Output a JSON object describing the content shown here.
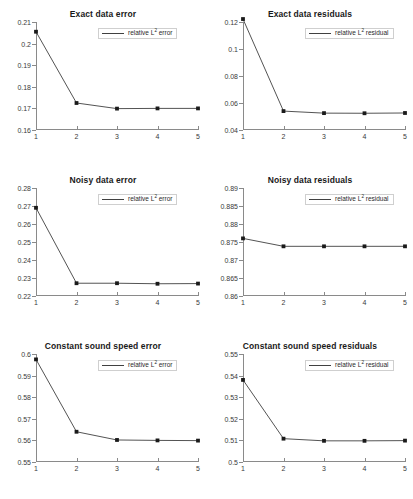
{
  "figure": {
    "rows": 3,
    "cols": 2,
    "background": "#ffffff",
    "line_color": "#404040",
    "marker_color": "#1a1a1a",
    "axis_color": "#8a8a8a"
  },
  "chart_data": [
    {
      "type": "line",
      "panel": "top-left",
      "title": "Exact data error",
      "xlabel": "",
      "ylabel": "",
      "x": [
        1,
        2,
        3,
        4,
        5
      ],
      "values": [
        0.2055,
        0.1725,
        0.1699,
        0.17,
        0.17
      ],
      "series": [
        {
          "name": "relative L2 error",
          "legend_prefix": "relative L",
          "legend_sup": "2",
          "legend_suffix": " error",
          "values": [
            0.2055,
            0.1725,
            0.1699,
            0.17,
            0.17
          ]
        }
      ],
      "xlim": [
        1,
        5
      ],
      "ylim": [
        0.16,
        0.21
      ],
      "yticks": [
        0.16,
        0.17,
        0.18,
        0.19,
        0.2,
        0.21
      ],
      "ytick_labels": [
        "0.16",
        "0.17",
        "0.18",
        "0.19",
        "0.2",
        "0.21"
      ],
      "xticks": [
        1,
        2,
        3,
        4,
        5
      ],
      "xtick_labels": [
        "1",
        "2",
        "3",
        "4",
        "5"
      ],
      "grid": false,
      "legend_position": "top-right",
      "marker": "square"
    },
    {
      "type": "line",
      "panel": "top-right",
      "title": "Exact data residuals",
      "xlabel": "",
      "ylabel": "",
      "x": [
        1,
        2,
        3,
        4,
        5
      ],
      "values": [
        0.1222,
        0.054,
        0.0525,
        0.0524,
        0.0526
      ],
      "series": [
        {
          "name": "relative L2 residual",
          "legend_prefix": "relative L",
          "legend_sup": "2",
          "legend_suffix": " residual",
          "values": [
            0.1222,
            0.054,
            0.0525,
            0.0524,
            0.0526
          ]
        }
      ],
      "xlim": [
        1,
        5
      ],
      "ylim": [
        0.04,
        0.12
      ],
      "yticks": [
        0.04,
        0.06,
        0.08,
        0.1,
        0.12
      ],
      "ytick_labels": [
        "0.04",
        "0.06",
        "0.08",
        "0.1",
        "0.12"
      ],
      "xticks": [
        1,
        2,
        3,
        4,
        5
      ],
      "xtick_labels": [
        "1",
        "2",
        "3",
        "4",
        "5"
      ],
      "grid": false,
      "legend_position": "top-right",
      "marker": "square"
    },
    {
      "type": "line",
      "panel": "middle-left",
      "title": "Noisy data error",
      "xlabel": "",
      "ylabel": "",
      "x": [
        1,
        2,
        3,
        4,
        5
      ],
      "values": [
        0.269,
        0.2271,
        0.2271,
        0.2268,
        0.2269
      ],
      "series": [
        {
          "name": "relative L2 error",
          "legend_prefix": "relative L",
          "legend_sup": "2",
          "legend_suffix": " error",
          "values": [
            0.269,
            0.2271,
            0.2271,
            0.2268,
            0.2269
          ]
        }
      ],
      "xlim": [
        1,
        5
      ],
      "ylim": [
        0.22,
        0.28
      ],
      "yticks": [
        0.22,
        0.23,
        0.24,
        0.25,
        0.26,
        0.27,
        0.28
      ],
      "ytick_labels": [
        "0.22",
        "0.23",
        "0.24",
        "0.25",
        "0.26",
        "0.27",
        "0.28"
      ],
      "xticks": [
        1,
        2,
        3,
        4,
        5
      ],
      "xtick_labels": [
        "1",
        "2",
        "3",
        "4",
        "5"
      ],
      "grid": false,
      "legend_position": "top-right",
      "marker": "square"
    },
    {
      "type": "line",
      "panel": "middle-right",
      "title": "Noisy data residuals",
      "xlabel": "",
      "ylabel": "",
      "x": [
        1,
        2,
        3,
        4,
        5
      ],
      "values": [
        0.876,
        0.8738,
        0.8738,
        0.8738,
        0.8738
      ],
      "series": [
        {
          "name": "relative L2 residual",
          "legend_prefix": "relative L",
          "legend_sup": "2",
          "legend_suffix": " residual",
          "values": [
            0.876,
            0.8738,
            0.8738,
            0.8738,
            0.8738
          ]
        }
      ],
      "xlim": [
        1,
        5
      ],
      "ylim": [
        0.86,
        0.89
      ],
      "yticks": [
        0.86,
        0.865,
        0.87,
        0.875,
        0.88,
        0.885,
        0.89
      ],
      "ytick_labels": [
        "0.86",
        "0.865",
        "0.87",
        "0.875",
        "0.88",
        "0.885",
        "0.89"
      ],
      "xticks": [
        1,
        2,
        3,
        4,
        5
      ],
      "xtick_labels": [
        "1",
        "2",
        "3",
        "4",
        "5"
      ],
      "grid": false,
      "legend_position": "top-right",
      "marker": "square"
    },
    {
      "type": "line",
      "panel": "bottom-left",
      "title": "Constant sound speed error",
      "xlabel": "",
      "ylabel": "",
      "x": [
        1,
        2,
        3,
        4,
        5
      ],
      "values": [
        0.5975,
        0.564,
        0.5602,
        0.56,
        0.5599
      ],
      "series": [
        {
          "name": "relative L2 error",
          "legend_prefix": "relative L",
          "legend_sup": "2",
          "legend_suffix": " error",
          "values": [
            0.5975,
            0.564,
            0.5602,
            0.56,
            0.5599
          ]
        }
      ],
      "xlim": [
        1,
        5
      ],
      "ylim": [
        0.55,
        0.6
      ],
      "yticks": [
        0.55,
        0.56,
        0.57,
        0.58,
        0.59,
        0.6
      ],
      "ytick_labels": [
        "0.55",
        "0.56",
        "0.57",
        "0.58",
        "0.59",
        "0.6"
      ],
      "xticks": [
        1,
        2,
        3,
        4,
        5
      ],
      "xtick_labels": [
        "1",
        "2",
        "3",
        "4",
        "5"
      ],
      "grid": false,
      "legend_position": "top-right",
      "marker": "square"
    },
    {
      "type": "line",
      "panel": "bottom-right",
      "title": "Constant sound speed residuals",
      "xlabel": "",
      "ylabel": "",
      "x": [
        1,
        2,
        3,
        4,
        5
      ],
      "values": [
        0.538,
        0.5108,
        0.5098,
        0.5098,
        0.5099
      ],
      "series": [
        {
          "name": "relative L2 residual",
          "legend_prefix": "relative L",
          "legend_sup": "2",
          "legend_suffix": " residual",
          "values": [
            0.538,
            0.5108,
            0.5098,
            0.5098,
            0.5099
          ]
        }
      ],
      "xlim": [
        1,
        5
      ],
      "ylim": [
        0.5,
        0.55
      ],
      "yticks": [
        0.5,
        0.51,
        0.52,
        0.53,
        0.54,
        0.55
      ],
      "ytick_labels": [
        "0.5",
        "0.51",
        "0.52",
        "0.53",
        "0.54",
        "0.55"
      ],
      "xticks": [
        1,
        2,
        3,
        4,
        5
      ],
      "xtick_labels": [
        "1",
        "2",
        "3",
        "4",
        "5"
      ],
      "grid": false,
      "legend_position": "top-right",
      "marker": "square"
    }
  ]
}
